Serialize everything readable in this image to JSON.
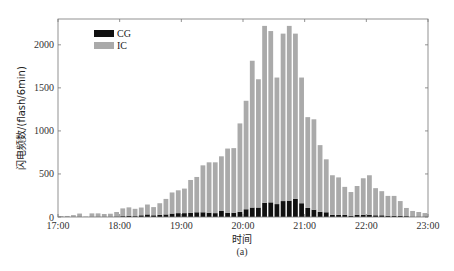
{
  "chart_data": {
    "type": "bar",
    "stacked": true,
    "title": "",
    "subtitle": "(a)",
    "xlabel": "时间",
    "ylabel": "闪电频数/(flash/6min)",
    "x_start": "17:00",
    "x_end": "23:00",
    "bin_minutes": 6,
    "xticks": [
      "17:00",
      "18:00",
      "19:00",
      "20:00",
      "21:00",
      "22:00",
      "23:00"
    ],
    "yticks": [
      0,
      500,
      1000,
      1500,
      2000
    ],
    "ylim": [
      0,
      2300
    ],
    "grid": false,
    "legend_position": "upper-left",
    "series": [
      {
        "name": "CG",
        "color": "#111111",
        "values": [
          0,
          0,
          2,
          4,
          0,
          3,
          4,
          4,
          4,
          6,
          10,
          15,
          10,
          20,
          30,
          20,
          25,
          30,
          40,
          45,
          45,
          50,
          55,
          55,
          50,
          45,
          70,
          50,
          50,
          60,
          90,
          110,
          110,
          165,
          170,
          150,
          185,
          190,
          210,
          160,
          105,
          85,
          60,
          55,
          25,
          25,
          25,
          15,
          25,
          25,
          25,
          20,
          20,
          15,
          15,
          15,
          10,
          5,
          5,
          5
        ]
      },
      {
        "name": "IC",
        "color": "#aaaaaa",
        "values": [
          10,
          12,
          20,
          36,
          5,
          39,
          38,
          31,
          34,
          52,
          90,
          97,
          85,
          90,
          115,
          95,
          135,
          180,
          245,
          265,
          285,
          380,
          410,
          545,
          585,
          590,
          635,
          745,
          750,
          1027,
          1260,
          1705,
          1490,
          2055,
          1990,
          1470,
          1945,
          2030,
          1920,
          1460,
          1055,
          1050,
          775,
          615,
          460,
          435,
          325,
          275,
          335,
          425,
          460,
          315,
          280,
          230,
          230,
          170,
          95,
          65,
          53,
          41
        ]
      }
    ]
  }
}
